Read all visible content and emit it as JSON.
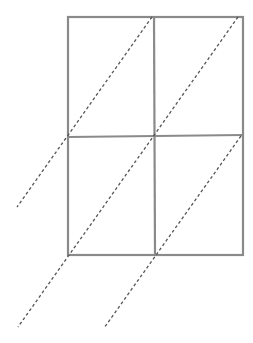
{
  "diagram": {
    "colors": {
      "grid": "#8a8a8a",
      "dash": "#555555",
      "background": "#ffffff"
    },
    "grid": {
      "x": [
        67,
        154,
        243
      ],
      "y": [
        17,
        137,
        255
      ]
    },
    "diagonals": [
      {
        "x1": 152,
        "y1": 17,
        "x2": 17,
        "y2": 207
      },
      {
        "x1": 238,
        "y1": 17,
        "x2": 18,
        "y2": 327
      },
      {
        "x1": 241,
        "y1": 137,
        "x2": 104,
        "y2": 328
      }
    ]
  }
}
